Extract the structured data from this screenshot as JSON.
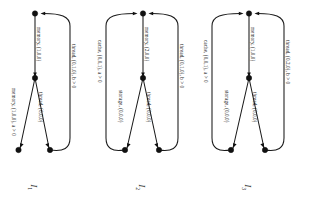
{
  "figure": {
    "orientation": "rotated-90",
    "background_color": "#ffffff",
    "ink_color": "#111111",
    "diagram_count": 3
  },
  "diagrams": [
    {
      "id": "I1",
      "caption": "I",
      "caption_subscript": "1",
      "nodes": [
        {
          "name": "root-node",
          "id": "n0"
        },
        {
          "name": "branch-node",
          "id": "n1"
        },
        {
          "name": "leaf-node-left",
          "id": "n2"
        },
        {
          "name": "leaf-node-right",
          "id": "n3"
        }
      ],
      "edges": [
        {
          "name": "edge-root-to-branch",
          "label": "memory, (1,0,0)"
        },
        {
          "name": "edge-branch-to-leaf-left",
          "label": "memory, (1,0,0), a > 0"
        },
        {
          "name": "edge-branch-to-leaf-right",
          "label": "thread, (0,0,0)"
        },
        {
          "name": "back-edge",
          "label": "thread, (0,1,0), b > 0"
        }
      ]
    },
    {
      "id": "I2",
      "caption": "I",
      "caption_subscript": "2",
      "nodes": [
        {
          "name": "root-node",
          "id": "n0"
        },
        {
          "name": "branch-node",
          "id": "n1"
        },
        {
          "name": "leaf-node-left",
          "id": "n2"
        },
        {
          "name": "leaf-node-right",
          "id": "n3"
        }
      ],
      "edges": [
        {
          "name": "edge-root-to-branch",
          "label": "memory, (2,0,0)"
        },
        {
          "name": "edge-branch-to-leaf-left",
          "label": "storage, (0,0,0)"
        },
        {
          "name": "edge-branch-to-leaf-right",
          "label": "thread, (0,0,0)"
        },
        {
          "name": "back-edge-left",
          "label": "cache, (0,0,1), a > 0"
        },
        {
          "name": "back-edge-right",
          "label": "thread, (0,1,0), b > 0"
        }
      ]
    },
    {
      "id": "I3",
      "caption": "I",
      "caption_subscript": "3",
      "nodes": [
        {
          "name": "root-node",
          "id": "n0"
        },
        {
          "name": "branch-node",
          "id": "n1"
        },
        {
          "name": "leaf-node-left",
          "id": "n2"
        },
        {
          "name": "leaf-node-right",
          "id": "n3"
        }
      ],
      "edges": [
        {
          "name": "edge-root-to-branch",
          "label": "memory, (1,0,0)"
        },
        {
          "name": "edge-branch-to-leaf-left",
          "label": "storage, (0,0,0)"
        },
        {
          "name": "edge-branch-to-leaf-right",
          "label": "thread, (0,0,0)"
        },
        {
          "name": "back-edge-left",
          "label": "cache, (0,0,1), a > 0"
        },
        {
          "name": "back-edge-right",
          "label": "thread, (0,2,0), b > 0"
        }
      ]
    }
  ]
}
